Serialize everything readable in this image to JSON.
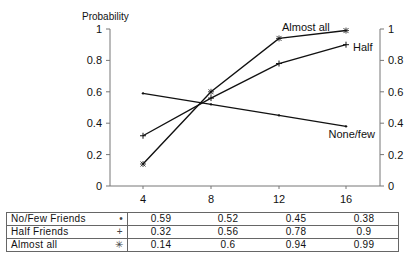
{
  "chart_data": {
    "type": "line",
    "title": "",
    "ylabel": "Probability",
    "xlabel": "",
    "x": [
      4,
      8,
      12,
      16
    ],
    "ylim": [
      0,
      1
    ],
    "yticks": [
      "0",
      "0.2",
      "0.4",
      "0.6",
      "0.8",
      "1"
    ],
    "grid": false,
    "secondary_y_axis": true,
    "series": [
      {
        "name": "No/Few Friends",
        "line_label": "None/few",
        "marker": "dot",
        "values": [
          0.59,
          0.52,
          0.45,
          0.38
        ]
      },
      {
        "name": "Half Friends",
        "line_label": "Half",
        "marker": "plus",
        "values": [
          0.32,
          0.56,
          0.78,
          0.9
        ]
      },
      {
        "name": "Almost all",
        "line_label": "Almost all",
        "marker": "asterisk",
        "values": [
          0.14,
          0.6,
          0.94,
          0.99
        ]
      }
    ],
    "legend_position": "data table below"
  },
  "table": {
    "rows": [
      {
        "label": "No/Few Friends",
        "marker": "•",
        "values": [
          "0.59",
          "0.52",
          "0.45",
          "0.38"
        ]
      },
      {
        "label": "Half Friends",
        "marker": "+",
        "values": [
          "0.32",
          "0.56",
          "0.78",
          "0.9"
        ]
      },
      {
        "label": "Almost all",
        "marker": "✳",
        "values": [
          "0.14",
          "0.6",
          "0.94",
          "0.99"
        ]
      }
    ]
  }
}
